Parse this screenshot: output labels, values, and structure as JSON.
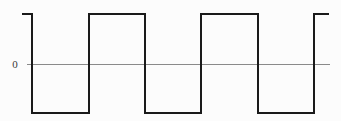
{
  "figure": {
    "kind": "square-wave-plot",
    "background_color": "#fcfcfc",
    "axis_label": "0",
    "axis_color": "#8a8a8a",
    "axis_line_width": 1,
    "axis_x_start": 27,
    "axis_x_end": 330,
    "axis_y": 64,
    "wave_color": "#1a1a1a",
    "wave_line_width": 2.6
  },
  "chart_data": {
    "type": "line",
    "title": "",
    "xlabel": "",
    "ylabel": "",
    "subtitle": "",
    "grid": false,
    "legend": false,
    "waveform": "square",
    "levels": {
      "high": 1,
      "low": -1,
      "zero": 0
    },
    "tick_labels": {
      "y": [
        "0"
      ],
      "x": []
    },
    "ylim": [
      -1.2,
      1.2
    ],
    "xlim": [
      0,
      341
    ],
    "pixel_levels": {
      "high_y": 14,
      "zero_y": 64,
      "low_y": 113
    },
    "transitions_px": [
      22,
      32,
      89,
      145,
      201,
      258,
      314,
      329
    ],
    "segments": [
      {
        "x0": 22,
        "x1": 32,
        "level": "high"
      },
      {
        "x0": 32,
        "x1": 89,
        "level": "low"
      },
      {
        "x0": 89,
        "x1": 145,
        "level": "high"
      },
      {
        "x0": 145,
        "x1": 201,
        "level": "low"
      },
      {
        "x0": 201,
        "x1": 258,
        "level": "high"
      },
      {
        "x0": 258,
        "x1": 314,
        "level": "low"
      },
      {
        "x0": 314,
        "x1": 329,
        "level": "high"
      }
    ],
    "path_d": "M 22 14 L 32 14 L 32 113 L 89 113 L 89 14 L 145 14 L 145 113 L 201 113 L 201 14 L 258 14 L 258 113 L 314 113 L 314 14 L 329 14"
  }
}
